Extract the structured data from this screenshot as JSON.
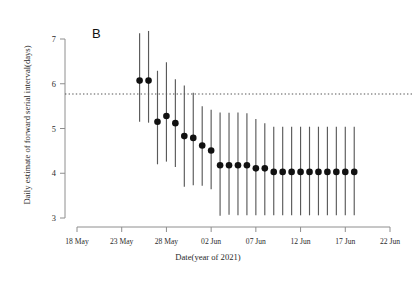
{
  "figure": {
    "panel_label": "B",
    "top_cropped_text": "· ·· ·  ·· ···   ··· ·"
  },
  "chart_data": {
    "type": "scatter",
    "title": "",
    "subtitle": "",
    "xlabel": "Date(year of 2021)",
    "ylabel": "Daily estimate of forward serial interval(days)",
    "ylim": [
      3,
      7
    ],
    "ytick_labels": [
      "3",
      "4",
      "5",
      "6",
      "7"
    ],
    "ytick_values": [
      3,
      4,
      5,
      6,
      7
    ],
    "xtick_labels": [
      "18 May",
      "23 May",
      "28 May",
      "02 Jun",
      "07 Jun",
      "12 Jun",
      "17 Jun",
      "22 Jun"
    ],
    "xtick_days": [
      0,
      5,
      10,
      15,
      20,
      25,
      30,
      35
    ],
    "xlim_days": [
      0,
      35
    ],
    "grid": false,
    "legend": null,
    "marker": "filled-circle",
    "error_bar_style": "vertical-line",
    "reference_line": {
      "label": "overall serial interval estimate",
      "value": 5.77,
      "style": "dotted",
      "orientation": "horizontal",
      "color": "#555555"
    },
    "series": [
      {
        "name": "Daily forward serial interval estimate",
        "color": "#111111",
        "error_color": "#5a5a5a",
        "points": [
          {
            "date": "25 May",
            "x_day": 7,
            "y": 6.07,
            "lo": 5.15,
            "hi": 7.13
          },
          {
            "date": "26 May",
            "x_day": 8,
            "y": 6.07,
            "lo": 5.13,
            "hi": 7.18
          },
          {
            "date": "27 May",
            "x_day": 9,
            "y": 5.15,
            "lo": 4.2,
            "hi": 6.29
          },
          {
            "date": "28 May",
            "x_day": 10,
            "y": 5.28,
            "lo": 4.26,
            "hi": 6.48
          },
          {
            "date": "29 May",
            "x_day": 11,
            "y": 5.12,
            "lo": 4.14,
            "hi": 6.1
          },
          {
            "date": "30 May",
            "x_day": 12,
            "y": 4.83,
            "lo": 3.7,
            "hi": 5.96
          },
          {
            "date": "31 May",
            "x_day": 13,
            "y": 4.79,
            "lo": 3.73,
            "hi": 5.8
          },
          {
            "date": "01 Jun",
            "x_day": 14,
            "y": 4.62,
            "lo": 3.72,
            "hi": 5.5
          },
          {
            "date": "02 Jun",
            "x_day": 15,
            "y": 4.51,
            "lo": 3.64,
            "hi": 5.42
          },
          {
            "date": "03 Jun",
            "x_day": 16,
            "y": 4.18,
            "lo": 3.05,
            "hi": 5.36
          },
          {
            "date": "04 Jun",
            "x_day": 17,
            "y": 4.18,
            "lo": 3.07,
            "hi": 5.35
          },
          {
            "date": "05 Jun",
            "x_day": 18,
            "y": 4.18,
            "lo": 3.06,
            "hi": 5.36
          },
          {
            "date": "06 Jun",
            "x_day": 19,
            "y": 4.18,
            "lo": 3.06,
            "hi": 5.34
          },
          {
            "date": "07 Jun",
            "x_day": 20,
            "y": 4.11,
            "lo": 3.06,
            "hi": 5.21
          },
          {
            "date": "08 Jun",
            "x_day": 21,
            "y": 4.11,
            "lo": 3.06,
            "hi": 5.12
          },
          {
            "date": "09 Jun",
            "x_day": 22,
            "y": 4.03,
            "lo": 3.06,
            "hi": 5.04
          },
          {
            "date": "10 Jun",
            "x_day": 23,
            "y": 4.03,
            "lo": 3.06,
            "hi": 5.04
          },
          {
            "date": "11 Jun",
            "x_day": 24,
            "y": 4.03,
            "lo": 3.06,
            "hi": 5.04
          },
          {
            "date": "12 Jun",
            "x_day": 25,
            "y": 4.03,
            "lo": 3.06,
            "hi": 5.04
          },
          {
            "date": "13 Jun",
            "x_day": 26,
            "y": 4.03,
            "lo": 3.06,
            "hi": 5.04
          },
          {
            "date": "14 Jun",
            "x_day": 27,
            "y": 4.03,
            "lo": 3.06,
            "hi": 5.04
          },
          {
            "date": "15 Jun",
            "x_day": 28,
            "y": 4.03,
            "lo": 3.06,
            "hi": 5.04
          },
          {
            "date": "16 Jun",
            "x_day": 29,
            "y": 4.03,
            "lo": 3.06,
            "hi": 5.04
          },
          {
            "date": "17 Jun",
            "x_day": 30,
            "y": 4.03,
            "lo": 3.06,
            "hi": 5.04
          },
          {
            "date": "18 Jun",
            "x_day": 31,
            "y": 4.03,
            "lo": 3.06,
            "hi": 5.04
          }
        ]
      }
    ]
  }
}
